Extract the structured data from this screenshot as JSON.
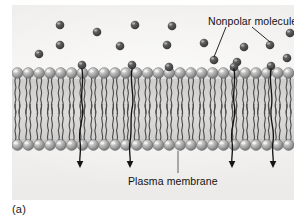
{
  "figure": {
    "panel_label": "(a)",
    "labels": {
      "nonpolar": "Nonpolar molecules",
      "plasma_membrane": "Plasma membrane"
    }
  },
  "colors": {
    "background": "#f2f1ef",
    "molecule_dark": "#4a4a4a",
    "molecule_highlight": "#9a9a9a",
    "head_light": "#cfcfcf",
    "head_mid": "#8f8f8f",
    "head_dark": "#6b6b6b",
    "tail": "#4d4d4d",
    "core": "#d9d8d6",
    "arrow": "#141414",
    "text": "#111111"
  },
  "chart_data": {
    "type": "diagram",
    "membrane": {
      "top_leaflet_y": 68,
      "bottom_leaflet_y": 140,
      "head_count_per_leaflet": 26,
      "head_radius": 5.4,
      "tails_per_lipid": 2,
      "core_top": 80,
      "core_bottom": 134
    },
    "nonpolar_molecules": [
      {
        "x": 48,
        "y": 20
      },
      {
        "x": 85,
        "y": 27
      },
      {
        "x": 123,
        "y": 20
      },
      {
        "x": 160,
        "y": 21
      },
      {
        "x": 192,
        "y": 38
      },
      {
        "x": 232,
        "y": 42
      },
      {
        "x": 258,
        "y": 40
      },
      {
        "x": 275,
        "y": 53
      },
      {
        "x": 48,
        "y": 40
      },
      {
        "x": 27,
        "y": 49
      },
      {
        "x": 108,
        "y": 41
      },
      {
        "x": 155,
        "y": 40
      },
      {
        "x": 202,
        "y": 55
      },
      {
        "x": 225,
        "y": 57
      },
      {
        "x": 70,
        "y": 60
      },
      {
        "x": 120,
        "y": 60
      },
      {
        "x": 157,
        "y": 62
      },
      {
        "x": 222,
        "y": 62
      },
      {
        "x": 259,
        "y": 61
      },
      {
        "x": 278,
        "y": 28
      }
    ],
    "permeation_arrows": [
      {
        "entry_x": 70,
        "exit_x": 68,
        "start_y": 64,
        "end_y": 162
      },
      {
        "entry_x": 120,
        "exit_x": 118,
        "start_y": 64,
        "end_y": 162
      },
      {
        "entry_x": 222,
        "exit_x": 220,
        "start_y": 64,
        "end_y": 162
      },
      {
        "entry_x": 259,
        "exit_x": 261,
        "start_y": 64,
        "end_y": 162
      }
    ],
    "leader_lines": {
      "nonpolar": [
        {
          "from_x": 214,
          "from_y": 22,
          "to_x": 202,
          "to_y": 52
        },
        {
          "from_x": 240,
          "from_y": 22,
          "to_x": 258,
          "to_y": 37
        }
      ],
      "plasma_membrane": [
        {
          "from_x": 166,
          "from_y": 168,
          "to_x": 166,
          "to_y": 146
        }
      ]
    }
  }
}
